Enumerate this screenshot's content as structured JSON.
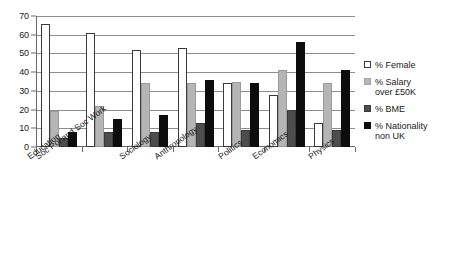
{
  "chart_data": {
    "type": "bar",
    "title": "",
    "subtitle": "",
    "xlabel": "",
    "ylabel": "",
    "ylim": [
      0,
      70
    ],
    "ytick_step": 10,
    "yticks": [
      70,
      60,
      50,
      40,
      30,
      20,
      10,
      0
    ],
    "grid": true,
    "legend_position": "right",
    "categories": [
      "Education",
      "Soc Pol and Soc Work",
      "Sociology",
      "Anthropology",
      "Politics",
      "Economics",
      "Physics"
    ],
    "series": [
      {
        "name": "% Female",
        "color": "#ffffff",
        "values": [
          66,
          61,
          52,
          53,
          34,
          28,
          13
        ]
      },
      {
        "name": "% Salary over £50K",
        "color": "#b5b5b5",
        "values": [
          19,
          22,
          34,
          34,
          35,
          41,
          34
        ]
      },
      {
        "name": "% BME",
        "color": "#4d4d4d",
        "values": [
          5,
          8,
          8,
          13,
          9,
          20,
          9
        ]
      },
      {
        "name": "% Nationality non UK",
        "color": "#0d0d0d",
        "values": [
          8,
          15,
          17,
          36,
          34,
          56,
          41
        ]
      }
    ]
  },
  "legend": {
    "items": [
      {
        "label": "% Female"
      },
      {
        "label": "% Salary\nover £50K"
      },
      {
        "label": "% BME"
      },
      {
        "label": "% Nationality\nnon UK"
      }
    ]
  }
}
